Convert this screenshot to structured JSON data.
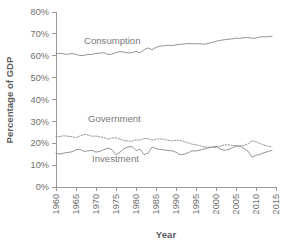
{
  "chart_data": {
    "type": "line",
    "title": "",
    "xlabel": "Year",
    "ylabel": "Percentage of GDP",
    "xlim": [
      1960,
      2015
    ],
    "ylim": [
      0,
      80
    ],
    "grid": false,
    "legend_position": "inline-annotations",
    "yticks": [
      0,
      10,
      20,
      30,
      40,
      50,
      60,
      70,
      80
    ],
    "ytick_labels": [
      "0%",
      "10%",
      "20%",
      "30%",
      "40%",
      "50%",
      "60%",
      "70%",
      "80%"
    ],
    "xticks": [
      1960,
      1965,
      1970,
      1975,
      1980,
      1985,
      1990,
      1995,
      2000,
      2005,
      2010,
      2015
    ],
    "xtick_labels": [
      "1960",
      "1965",
      "1970",
      "1975",
      "1980",
      "1985",
      "1990",
      "1995",
      "2000",
      "2005",
      "2010",
      "2015"
    ],
    "x": [
      1960,
      1961,
      1962,
      1963,
      1964,
      1965,
      1966,
      1967,
      1968,
      1969,
      1970,
      1971,
      1972,
      1973,
      1974,
      1975,
      1976,
      1977,
      1978,
      1979,
      1980,
      1981,
      1982,
      1983,
      1984,
      1985,
      1986,
      1987,
      1988,
      1989,
      1990,
      1991,
      1992,
      1993,
      1994,
      1995,
      1996,
      1997,
      1998,
      1999,
      2000,
      2001,
      2002,
      2003,
      2004,
      2005,
      2006,
      2007,
      2008,
      2009,
      2010,
      2011,
      2012,
      2013,
      2014
    ],
    "series": [
      {
        "name": "Consumption",
        "style": "solid",
        "color": "#8a8a8a",
        "label_x": 1967,
        "label_y": 65.5,
        "values": [
          61.0,
          61.1,
          60.8,
          60.7,
          61.0,
          60.6,
          60.1,
          60.2,
          60.6,
          60.6,
          61.1,
          61.2,
          61.4,
          60.6,
          60.7,
          61.5,
          61.8,
          61.7,
          61.3,
          61.4,
          62.0,
          61.4,
          62.7,
          63.6,
          62.8,
          63.8,
          64.4,
          64.6,
          64.8,
          64.6,
          65.0,
          65.2,
          65.4,
          65.6,
          65.5,
          65.5,
          65.5,
          65.3,
          65.6,
          66.1,
          66.6,
          67.0,
          67.3,
          67.5,
          67.7,
          68.0,
          68.0,
          68.3,
          68.3,
          68.0,
          68.1,
          68.6,
          68.7,
          68.7,
          68.9
        ]
      },
      {
        "name": "Government",
        "style": "dotted",
        "color": "#8a8a8a",
        "label_x": 1968,
        "label_y": 29.5,
        "values": [
          22.9,
          23.1,
          23.4,
          23.2,
          23.0,
          22.6,
          23.3,
          24.0,
          23.8,
          23.2,
          23.3,
          22.9,
          22.6,
          21.9,
          22.4,
          22.5,
          21.8,
          21.3,
          21.0,
          20.9,
          21.6,
          21.4,
          22.2,
          22.1,
          21.4,
          21.9,
          22.0,
          21.8,
          21.3,
          21.1,
          21.4,
          21.3,
          20.8,
          20.2,
          19.6,
          19.3,
          18.8,
          18.4,
          18.2,
          18.2,
          18.1,
          18.6,
          19.2,
          19.3,
          19.0,
          18.9,
          18.8,
          19.0,
          19.8,
          21.1,
          20.7,
          19.9,
          19.2,
          18.6,
          18.3
        ]
      },
      {
        "name": "Investment",
        "style": "solid",
        "color": "#8a8a8a",
        "label_x": 1969,
        "label_y": 11.6,
        "values": [
          15.5,
          15.0,
          15.5,
          15.8,
          16.1,
          17.0,
          17.2,
          16.3,
          16.5,
          16.8,
          15.9,
          16.4,
          17.1,
          17.8,
          17.1,
          14.7,
          16.0,
          17.5,
          18.3,
          18.5,
          16.6,
          17.3,
          14.8,
          15.4,
          18.3,
          17.5,
          17.2,
          17.0,
          16.6,
          16.6,
          15.9,
          14.7,
          15.0,
          15.6,
          16.5,
          16.5,
          16.9,
          17.4,
          17.9,
          18.2,
          18.6,
          17.4,
          16.8,
          17.0,
          17.9,
          18.7,
          18.7,
          17.6,
          16.4,
          13.6,
          14.5,
          14.9,
          15.7,
          16.2,
          16.8
        ]
      }
    ]
  }
}
